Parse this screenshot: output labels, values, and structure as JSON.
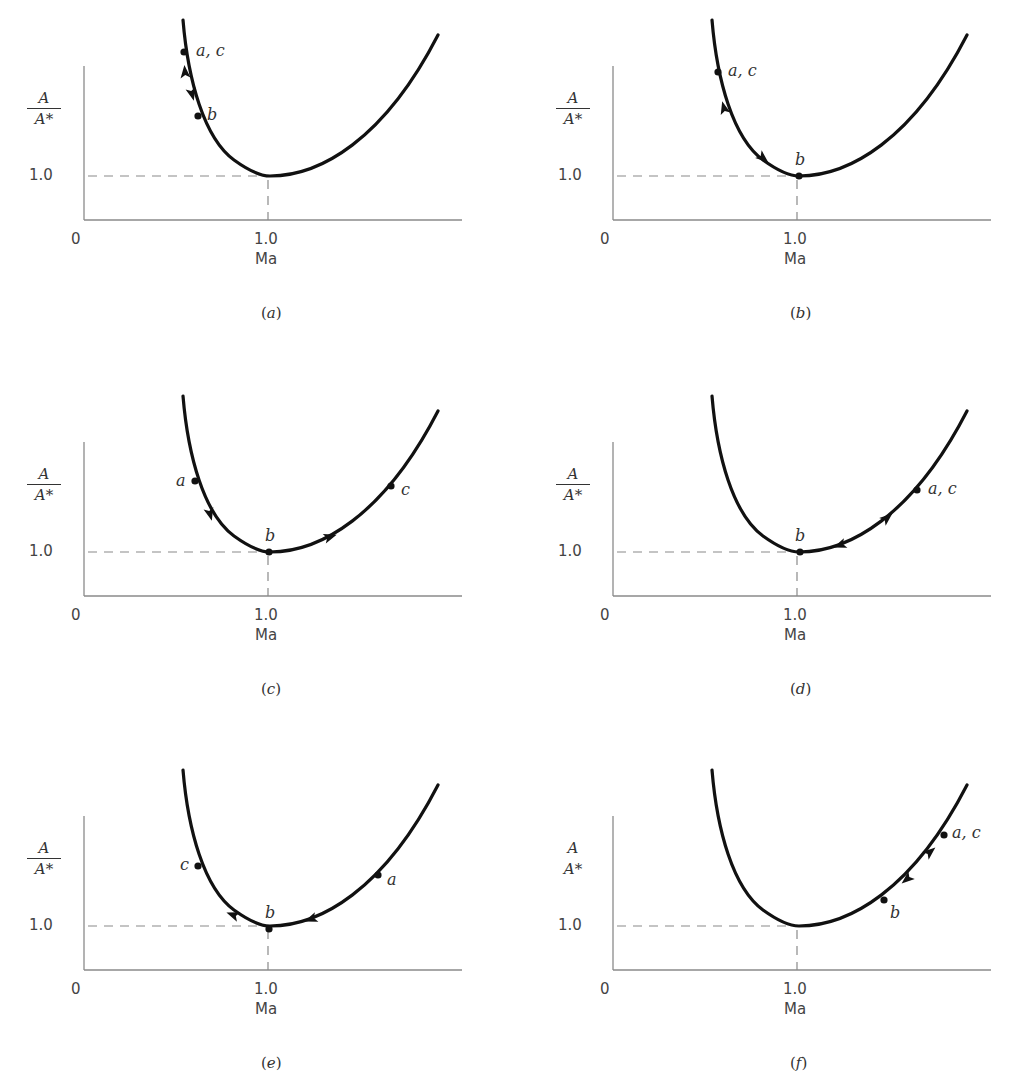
{
  "figure": {
    "x_axis_label": "Ma",
    "y_axis_label_numerator": "A",
    "y_axis_label_denominator": "A*",
    "origin_label": "0",
    "x_tick_label": "1.0",
    "y_tick_label": "1.0",
    "colors": {
      "curve": "#111111",
      "axis": "#8a8a8a",
      "text": "#333333"
    }
  },
  "panels": [
    {
      "id": "a",
      "caption_open": "(",
      "caption_letter": "a",
      "caption_close": ")",
      "frac_bar": true,
      "points": [
        {
          "label": "a, c",
          "x": 100,
          "y": 32,
          "lx": 12,
          "ly": -9
        },
        {
          "label": "b",
          "x": 114,
          "y": 96,
          "lx": 9,
          "ly": -9
        }
      ],
      "arrows": [
        {
          "x": 101,
          "y": 52,
          "dir": "up"
        },
        {
          "x": 108,
          "y": 74,
          "dir": "down"
        }
      ]
    },
    {
      "id": "b",
      "caption_open": "(",
      "caption_letter": "b",
      "caption_close": ")",
      "frac_bar": true,
      "points": [
        {
          "label": "a, c",
          "x": 105,
          "y": 52,
          "lx": 10,
          "ly": -9
        },
        {
          "label": "b",
          "x": 186,
          "y": 156,
          "lx": -4,
          "ly": -24
        }
      ],
      "arrows": [
        {
          "x": 111,
          "y": 88,
          "dir": "up"
        },
        {
          "x": 150,
          "y": 138,
          "dir": "down"
        }
      ]
    },
    {
      "id": "c",
      "caption_open": "(",
      "caption_letter": "c",
      "caption_close": ")",
      "frac_bar": true,
      "points": [
        {
          "label": "a",
          "x": 111,
          "y": 85,
          "lx": -19,
          "ly": -8
        },
        {
          "label": "b",
          "x": 185,
          "y": 156,
          "lx": -4,
          "ly": -24
        },
        {
          "label": "c",
          "x": 307,
          "y": 90,
          "lx": 10,
          "ly": -4
        }
      ],
      "arrows": [
        {
          "x": 126,
          "y": 118,
          "dir": "down"
        },
        {
          "x": 246,
          "y": 141,
          "dir": "right"
        }
      ]
    },
    {
      "id": "d",
      "caption_open": "(",
      "caption_letter": "d",
      "caption_close": ")",
      "frac_bar": true,
      "points": [
        {
          "label": "a, c",
          "x": 304,
          "y": 94,
          "lx": 11,
          "ly": -9
        },
        {
          "label": "b",
          "x": 187,
          "y": 156,
          "lx": -5,
          "ly": -24
        }
      ],
      "arrows": [
        {
          "x": 274,
          "y": 122,
          "dir": "right"
        },
        {
          "x": 227,
          "y": 149,
          "dir": "left"
        }
      ]
    },
    {
      "id": "e",
      "caption_open": "(",
      "caption_letter": "e",
      "caption_close": ")",
      "frac_bar": true,
      "points": [
        {
          "label": "c",
          "x": 114,
          "y": 96,
          "lx": -18,
          "ly": -9
        },
        {
          "label": "b",
          "x": 185,
          "y": 159,
          "lx": -4,
          "ly": -24
        },
        {
          "label": "a",
          "x": 294,
          "y": 105,
          "lx": 9,
          "ly": -3
        }
      ],
      "arrows": [
        {
          "x": 149,
          "y": 145,
          "dir": "left"
        },
        {
          "x": 227,
          "y": 149,
          "dir": "left"
        }
      ]
    },
    {
      "id": "f",
      "caption_open": "(",
      "caption_letter": "f",
      "caption_close": ")",
      "frac_bar": false,
      "points": [
        {
          "label": "a, c",
          "x": 331,
          "y": 65,
          "lx": 8,
          "ly": -10
        },
        {
          "label": "b",
          "x": 271,
          "y": 130,
          "lx": 6,
          "ly": 5
        }
      ],
      "arrows": [
        {
          "x": 317,
          "y": 82,
          "dir": "right"
        },
        {
          "x": 294,
          "y": 109,
          "dir": "left"
        }
      ]
    }
  ],
  "chart_data": {
    "type": "line",
    "xlabel": "Ma",
    "ylabel": "A/A*",
    "x_ticks": [
      "0",
      "1.0"
    ],
    "y_ticks": [
      "1.0"
    ],
    "grid": false,
    "reference_lines": [
      "dashed horizontal at A/A* = 1.0",
      "dashed vertical at Ma = 1.0"
    ],
    "curve": {
      "shape": "U-shaped, minimum A/A* = 1.0 at Ma = 1.0",
      "x": [
        0.58,
        0.65,
        0.75,
        0.85,
        1.0,
        1.2,
        1.4,
        1.6,
        1.8,
        1.9
      ],
      "y": [
        1.2,
        1.1,
        1.05,
        1.02,
        1.0,
        1.03,
        1.12,
        1.25,
        1.42,
        1.55
      ]
    },
    "panels": [
      {
        "panel": "a",
        "points": {
          "a,c": "subsonic, high A/A*",
          "b": "subsonic, nearer throat"
        },
        "path": "a → b → c (subsonic, returns along same branch)"
      },
      {
        "panel": "b",
        "points": {
          "a,c": "subsonic",
          "b": "Ma = 1 (sonic throat)"
        },
        "path": "a → b (sonic) → c (back to subsonic)"
      },
      {
        "panel": "c",
        "points": {
          "a": "subsonic",
          "b": "Ma = 1",
          "c": "supersonic"
        },
        "path": "a → b → c (subsonic to supersonic)"
      },
      {
        "panel": "d",
        "points": {
          "a,c": "supersonic",
          "b": "Ma = 1"
        },
        "path": "a → b → c (supersonic, returns to supersonic)"
      },
      {
        "panel": "e",
        "points": {
          "a": "supersonic",
          "b": "Ma = 1",
          "c": "subsonic"
        },
        "path": "a → b → c (supersonic to subsonic)"
      },
      {
        "panel": "f",
        "points": {
          "a,c": "supersonic, higher A/A*",
          "b": "supersonic, nearer throat"
        },
        "path": "a → b → c (supersonic branch only)"
      }
    ]
  }
}
